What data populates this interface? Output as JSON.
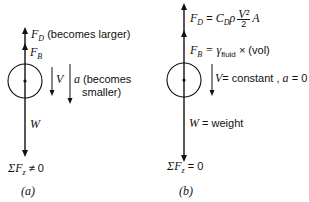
{
  "diagram_a": {
    "caption": "(a)",
    "drag_force": {
      "symbol": "F",
      "sub": "D",
      "note": "(becomes larger)"
    },
    "buoyant_force": {
      "symbol": "F",
      "sub": "B"
    },
    "velocity": {
      "symbol": "V"
    },
    "acceleration": {
      "symbol": "a",
      "note_line1": "(becomes",
      "note_line2": "smaller)"
    },
    "weight": {
      "symbol": "W"
    },
    "sum_forces": {
      "prefix": "ΣF",
      "sub": "z",
      "relation": "≠ 0"
    }
  },
  "diagram_b": {
    "caption": "(b)",
    "drag_force": {
      "symbol": "F",
      "sub": "D",
      "eq": "=",
      "coef": "C",
      "coef_sub": "D",
      "rho": "ρ",
      "num": "V²",
      "den": "2",
      "area": "A"
    },
    "buoyant_force": {
      "symbol": "F",
      "sub": "B",
      "eq": "= γ",
      "gamma_sub": "fluid",
      "rest": "× (vol)"
    },
    "velocity": {
      "symbol": "V",
      "text": "= constant ,",
      "a_symbol": "a",
      "a_text": "= 0"
    },
    "weight": {
      "symbol": "W",
      "text": "= weight"
    },
    "sum_forces": {
      "prefix": "ΣF",
      "sub": "z",
      "relation": "= 0"
    }
  },
  "colors": {
    "ink": "#111111",
    "background": "#ffffff"
  }
}
